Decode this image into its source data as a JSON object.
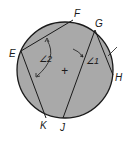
{
  "diagram": {
    "type": "circle-chords",
    "circle": {
      "cx": 65,
      "cy": 70,
      "r": 48,
      "fill": "#a9a9a9",
      "stroke": "#1a1a1a"
    },
    "center_mark": "+",
    "points": [
      {
        "name": "F",
        "x": 73,
        "y": 20,
        "label_x": 74,
        "label_y": 17
      },
      {
        "name": "G",
        "x": 95,
        "y": 30,
        "label_x": 96,
        "label_y": 27
      },
      {
        "name": "E",
        "x": 21,
        "y": 51,
        "label_x": 10,
        "label_y": 57
      },
      {
        "name": "H",
        "x": 113,
        "y": 75,
        "label_x": 115,
        "label_y": 81
      },
      {
        "name": "K",
        "x": 46,
        "y": 118,
        "label_x": 40,
        "label_y": 129
      },
      {
        "name": "J",
        "x": 63,
        "y": 118,
        "label_x": 60,
        "label_y": 131
      }
    ],
    "chords": [
      {
        "from": "E",
        "to": "F"
      },
      {
        "from": "E",
        "to": "K"
      },
      {
        "from": "G",
        "to": "J"
      },
      {
        "from": "G",
        "to": "H"
      }
    ],
    "angles": [
      {
        "label": "∠2",
        "x": 39,
        "y": 62
      },
      {
        "label": "∠1",
        "x": 86,
        "y": 63
      }
    ]
  }
}
